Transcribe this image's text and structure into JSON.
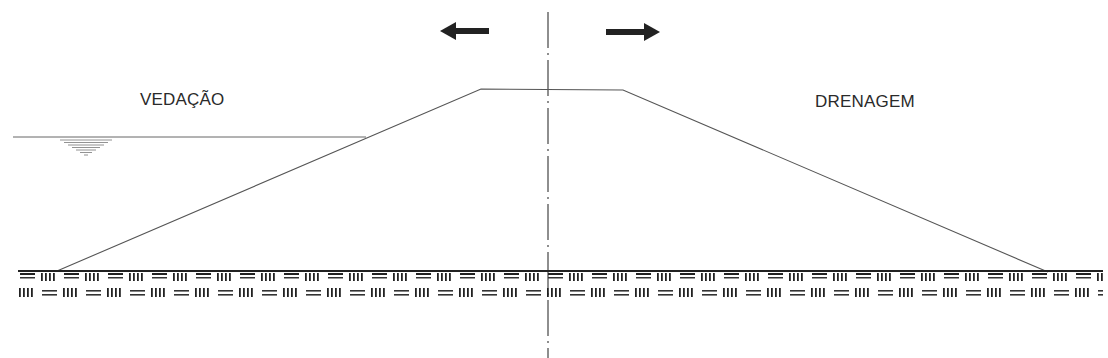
{
  "diagram": {
    "type": "dam-cross-section",
    "labels": {
      "left": "VEDAÇÃO",
      "right": "DRENAGEM"
    },
    "arrows": [
      {
        "direction": "left",
        "from": [
          488,
          31
        ],
        "to": [
          440,
          31
        ]
      },
      {
        "direction": "right",
        "from": [
          606,
          32
        ],
        "to": [
          660,
          32
        ]
      }
    ],
    "centerline": {
      "x": 548,
      "y_start": 12,
      "y_end": 358,
      "style": "dash-dot"
    },
    "embankment": {
      "points": [
        [
          57,
          271
        ],
        [
          481,
          89
        ],
        [
          623,
          90
        ],
        [
          1048,
          272
        ]
      ]
    },
    "water_level": {
      "x_start": 13,
      "x_end": 366,
      "y": 137
    },
    "ground_line": {
      "x_start": 18,
      "x_end": 1103,
      "y": 271
    },
    "foundation_hatch": {
      "rows": 2,
      "pattern": "═ ||||"
    },
    "colors": {
      "line": "#555555",
      "dark": "#222222",
      "background": "#ffffff"
    }
  }
}
